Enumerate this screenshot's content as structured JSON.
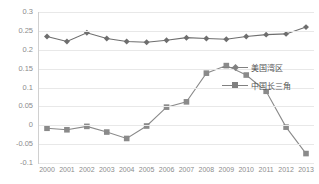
{
  "chart_data": {
    "type": "line",
    "title": "",
    "xlabel": "",
    "ylabel": "",
    "ylim": [
      -0.1,
      0.3
    ],
    "yticks": [
      0.3,
      0.25,
      0.2,
      0.15,
      0.1,
      0.05,
      0,
      -0.05,
      -0.1
    ],
    "ytick_labels": [
      "0.3",
      "0.25",
      "0.2",
      "0.15",
      "0.1",
      "0.05",
      "0",
      "-0.05",
      "-0.1"
    ],
    "grid": true,
    "legend_position": "right",
    "categories": [
      "2000",
      "2001",
      "2002",
      "2003",
      "2004",
      "2005",
      "2006",
      "2007",
      "2008",
      "2009",
      "2010",
      "2011",
      "2012",
      "2013"
    ],
    "series": [
      {
        "name": "美国湾区",
        "marker": "diamond",
        "color": "#6e6e6e",
        "values": [
          0.235,
          0.222,
          0.245,
          0.23,
          0.222,
          0.22,
          0.225,
          0.232,
          0.23,
          0.228,
          0.235,
          0.24,
          0.242,
          0.26
        ]
      },
      {
        "name": "中国长三角",
        "marker": "square",
        "color": "#8a8a8a",
        "values": [
          -0.008,
          -0.012,
          -0.003,
          -0.018,
          -0.035,
          -0.002,
          0.048,
          0.062,
          0.138,
          0.158,
          0.133,
          0.09,
          -0.005,
          -0.075
        ]
      }
    ]
  },
  "legend": {
    "items": [
      {
        "label": "美国湾区"
      },
      {
        "label": "中国长三角"
      }
    ]
  },
  "colors": {
    "series1": "#6e6e6e",
    "series2": "#8a8a8a",
    "grid": "#e8e8e8",
    "tick_text": "#8c8c8c"
  }
}
